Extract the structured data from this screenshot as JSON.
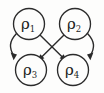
{
  "diagram": {
    "type": "directed-graph",
    "canvas": {
      "width": 104,
      "height": 93
    },
    "style": {
      "background_color": "#fdfdfc",
      "stroke_color": "#2b2b2b",
      "label_color": "#1d1d1d"
    },
    "nodes": [
      {
        "id": "rho1",
        "symbol": "ρ",
        "subscript": "1",
        "label": "ρ₁",
        "cx": 29,
        "cy": 24,
        "r": 15.5,
        "position": "top-left"
      },
      {
        "id": "rho2",
        "symbol": "ρ",
        "subscript": "2",
        "label": "ρ₂",
        "cx": 75,
        "cy": 24,
        "r": 15.5,
        "position": "top-right"
      },
      {
        "id": "rho3",
        "symbol": "ρ",
        "subscript": "3",
        "label": "ρ₃",
        "cx": 31,
        "cy": 70,
        "r": 15.5,
        "position": "bottom-left"
      },
      {
        "id": "rho4",
        "symbol": "ρ",
        "subscript": "4",
        "label": "ρ₄",
        "cx": 73,
        "cy": 70,
        "r": 15.5,
        "position": "bottom-right"
      }
    ],
    "edges": [
      {
        "id": "edge-rho1-rho3",
        "from": "rho1",
        "to": "rho3",
        "shape": "curve",
        "side": "left",
        "directed": true
      },
      {
        "id": "edge-rho2-rho4",
        "from": "rho2",
        "to": "rho4",
        "shape": "curve",
        "side": "right",
        "directed": true
      },
      {
        "id": "edge-rho1-rho4",
        "from": "rho1",
        "to": "rho4",
        "shape": "straight",
        "side": "diagonal",
        "directed": true
      },
      {
        "id": "edge-rho2-rho3",
        "from": "rho2",
        "to": "rho3",
        "shape": "straight",
        "side": "diagonal",
        "directed": true
      }
    ]
  }
}
